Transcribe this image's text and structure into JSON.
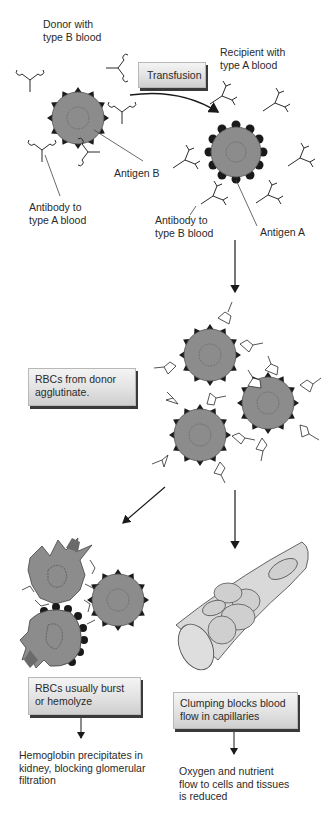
{
  "diagram": {
    "labels": {
      "donor": "Donor with\ntype B blood",
      "recipient": "Recipient with\ntype A blood",
      "transfusion": "Transfusion",
      "antigen_b": "Antigen B",
      "antigen_a": "Antigen A",
      "antibody_to_a": "Antibody to\ntype A blood",
      "antibody_to_b": "Antibody to\ntype B blood",
      "agglutinate": "RBCs from donor\nagglutinate.",
      "burst": "RBCs usually burst\nor hemolyze",
      "clumping": "Clumping blocks blood\nflow in capillaries",
      "hemoglobin": "Hemoglobin precipitates in\nkidney, blocking glomerular\nfiltration",
      "oxygen": "Oxygen and nutrient\nflow to cells and tissues\nis reduced"
    },
    "colors": {
      "cell_fill": "#8c8c8c",
      "antigen_b": "#1a1a1a",
      "antigen_a": "#2a2a2a",
      "box_shadow": "#3a3a3a",
      "capillary_fill": "#d9d9d9"
    }
  }
}
